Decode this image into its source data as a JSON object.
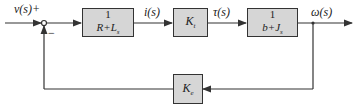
{
  "diagram": {
    "input_label": "v(s)",
    "plus_sign": "+",
    "minus_sign": "−",
    "blocks": {
      "electrical": {
        "numerator": "1",
        "denominator_main": "R+L",
        "denominator_sub": "s"
      },
      "torque_const": {
        "main": "K",
        "sub": "t"
      },
      "mechanical": {
        "numerator": "1",
        "denominator_main": "b+J",
        "denominator_sub": "s"
      },
      "back_emf": {
        "main": "K",
        "sub": "e"
      }
    },
    "signals": {
      "current": "i(s)",
      "torque": "τ(s)",
      "output": "ω(s)"
    },
    "colors": {
      "block_fill": "#d6d6d6",
      "line": "#333333"
    }
  }
}
